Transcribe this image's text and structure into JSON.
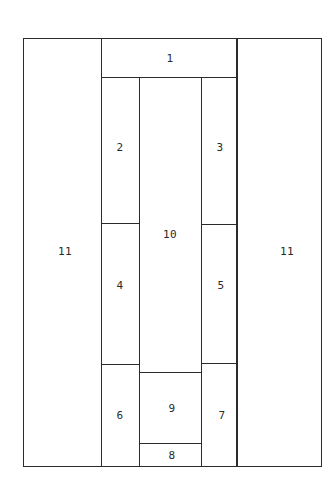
{
  "diagram": {
    "type": "floor-plan-layout",
    "regions": [
      {
        "id": "r1",
        "label": "1",
        "x": 101,
        "y": 38,
        "w": 136,
        "h": 39,
        "lx": 170,
        "ly": 58
      },
      {
        "id": "r2",
        "label": "2",
        "x": 101,
        "y": 77,
        "w": 38,
        "h": 146,
        "lx": 120,
        "ly": 147
      },
      {
        "id": "r3",
        "label": "3",
        "x": 201,
        "y": 77,
        "w": 36,
        "h": 147,
        "lx": 220,
        "ly": 147
      },
      {
        "id": "r4",
        "label": "4",
        "x": 101,
        "y": 223,
        "w": 38,
        "h": 141,
        "lx": 120,
        "ly": 285
      },
      {
        "id": "r5",
        "label": "5",
        "x": 201,
        "y": 224,
        "w": 36,
        "h": 139,
        "lx": 221,
        "ly": 285
      },
      {
        "id": "r6",
        "label": "6",
        "x": 101,
        "y": 364,
        "w": 38,
        "h": 102,
        "lx": 120,
        "ly": 415
      },
      {
        "id": "r7",
        "label": "7",
        "x": 201,
        "y": 363,
        "w": 36,
        "h": 103,
        "lx": 222,
        "ly": 415
      },
      {
        "id": "r8",
        "label": "8",
        "x": 139,
        "y": 443,
        "w": 62,
        "h": 23,
        "lx": 172,
        "ly": 455
      },
      {
        "id": "r9",
        "label": "9",
        "x": 139,
        "y": 372,
        "w": 62,
        "h": 71,
        "lx": 172,
        "ly": 408
      },
      {
        "id": "r10",
        "label": "10",
        "x": 139,
        "y": 77,
        "w": 62,
        "h": 295,
        "lx": 170,
        "ly": 234
      },
      {
        "id": "r11a",
        "label": "11",
        "x": 23,
        "y": 38,
        "w": 78,
        "h": 428,
        "lx": 65,
        "ly": 251
      },
      {
        "id": "r11b",
        "label": "11",
        "x": 237,
        "y": 38,
        "w": 84,
        "h": 428,
        "lx": 287,
        "ly": 251
      }
    ]
  },
  "labels": {
    "r1": "1",
    "r2": "2",
    "r3": "3",
    "r4": "4",
    "r5": "5",
    "r6": "6",
    "r7": "7",
    "r8": "8",
    "r9": "9",
    "r10": "10",
    "r11a": "11",
    "r11b": "11"
  }
}
